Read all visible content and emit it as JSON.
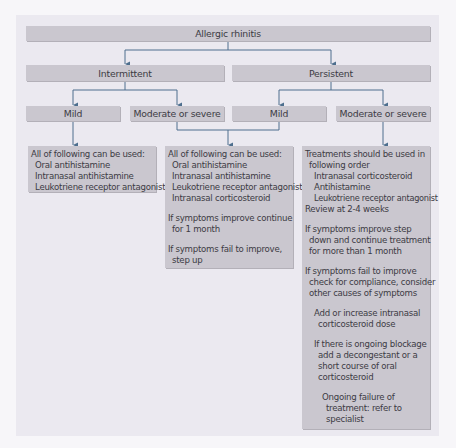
{
  "colors": {
    "background": "#f7f6f9",
    "panel": "#ebe9f0",
    "box": "#cac7cf",
    "connector": "#4e6f8e",
    "text": "#3c3b44"
  },
  "root": {
    "label": "Allergic rhinitis"
  },
  "level1": {
    "intermittent": {
      "label": "Intermittent"
    },
    "persistent": {
      "label": "Persistent"
    }
  },
  "level2": {
    "intermittent_mild": {
      "label": "Mild"
    },
    "intermittent_moderate": {
      "label": "Moderate or severe"
    },
    "persistent_mild": {
      "label": "Mild"
    },
    "persistent_moderate": {
      "label": "Moderate or severe"
    }
  },
  "treatments": {
    "mild_intermittent": {
      "lines": [
        "All of following can be used:",
        "Oral antihistamine",
        "Intranasal antihistamine",
        "Leukotriene receptor antagonist"
      ]
    },
    "moderate_intermittent_or_mild_persistent": {
      "lines": [
        "All of following can be used:",
        "Oral antihistamine",
        "Intranasal antihistamine",
        "Leukotriene receptor antagonist",
        "Intranasal corticosteroid",
        "If symptoms improve continue",
        "for 1 month",
        "If symptoms fail to improve,",
        "step up"
      ]
    },
    "moderate_persistent": {
      "lines": [
        "Treatments should be used in",
        "following order",
        "Intranasal corticosteroid",
        "Antihistamine",
        "Leukotriene receptor antagonist",
        "Review at 2-4 weeks",
        "If symptoms improve  step",
        "down and continue treatment",
        "for more than 1 month",
        "If symptoms fail to improve",
        "check for compliance, consider",
        "other causes of symptoms",
        "Add or increase intranasal",
        "corticosteroid dose",
        "If there is ongoing blockage",
        "add a decongestant or a",
        "short course of oral",
        "corticosteroid",
        "Ongoing failure of",
        "treatment: refer to",
        "specialist"
      ]
    }
  }
}
